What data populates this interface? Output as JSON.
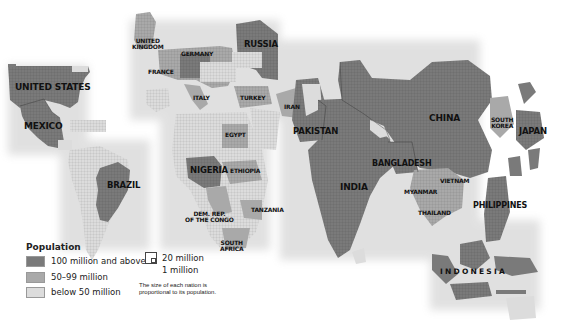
{
  "map": {
    "type": "population cartogram",
    "labels": [
      {
        "id": "united-states",
        "text": "UNITED STATES",
        "x": 15,
        "y": 83,
        "size": 9
      },
      {
        "id": "mexico",
        "text": "MEXICO",
        "x": 24,
        "y": 122,
        "size": 9
      },
      {
        "id": "united-kingdom",
        "text": "UNITED\nKINGDOM",
        "x": 132,
        "y": 38,
        "size": 6
      },
      {
        "id": "germany",
        "text": "GERMANY",
        "x": 181,
        "y": 51,
        "size": 6
      },
      {
        "id": "france",
        "text": "FRANCE",
        "x": 148,
        "y": 69,
        "size": 6
      },
      {
        "id": "russia",
        "text": "RUSSIA",
        "x": 244,
        "y": 40,
        "size": 8.5
      },
      {
        "id": "italy",
        "text": "ITALY",
        "x": 193,
        "y": 95,
        "size": 6
      },
      {
        "id": "turkey",
        "text": "TURKEY",
        "x": 240,
        "y": 95,
        "size": 6
      },
      {
        "id": "iran",
        "text": "IRAN",
        "x": 284,
        "y": 104,
        "size": 6
      },
      {
        "id": "pakistan",
        "text": "PAKISTAN",
        "x": 293,
        "y": 127,
        "size": 8.5
      },
      {
        "id": "egypt",
        "text": "EGYPT",
        "x": 225,
        "y": 132,
        "size": 6
      },
      {
        "id": "china",
        "text": "CHINA",
        "x": 429,
        "y": 114,
        "size": 9
      },
      {
        "id": "south-korea",
        "text": "SOUTH\nKOREA",
        "x": 491,
        "y": 117,
        "size": 6
      },
      {
        "id": "japan",
        "text": "JAPAN",
        "x": 519,
        "y": 127,
        "size": 8.5
      },
      {
        "id": "bangladesh",
        "text": "BANGLADESH",
        "x": 372,
        "y": 160,
        "size": 8
      },
      {
        "id": "india",
        "text": "INDIA",
        "x": 340,
        "y": 183,
        "size": 9
      },
      {
        "id": "vietnam",
        "text": "VIETNAM",
        "x": 440,
        "y": 178,
        "size": 6
      },
      {
        "id": "myanmar",
        "text": "MYANMAR",
        "x": 404,
        "y": 189,
        "size": 6
      },
      {
        "id": "thailand",
        "text": "THAILAND",
        "x": 418,
        "y": 210,
        "size": 6
      },
      {
        "id": "philippines",
        "text": "PHILIPPINES",
        "x": 473,
        "y": 202,
        "size": 8
      },
      {
        "id": "brazil",
        "text": "BRAZIL",
        "x": 107,
        "y": 181,
        "size": 8.5
      },
      {
        "id": "nigeria",
        "text": "NIGERIA",
        "x": 190,
        "y": 166,
        "size": 8.5
      },
      {
        "id": "ethiopia",
        "text": "ETHIOPIA",
        "x": 230,
        "y": 168,
        "size": 6
      },
      {
        "id": "tanzania",
        "text": "TANZANIA",
        "x": 251,
        "y": 207,
        "size": 6
      },
      {
        "id": "dem-rep-congo",
        "text": "DEM. REP.\nOF THE CONGO",
        "x": 185,
        "y": 211,
        "size": 6
      },
      {
        "id": "south-africa",
        "text": "SOUTH\nAFRICA",
        "x": 220,
        "y": 240,
        "size": 6
      },
      {
        "id": "indonesia",
        "text": "I N D O N E S I A",
        "x": 440,
        "y": 268,
        "size": 7.5
      }
    ]
  },
  "legend": {
    "title": "Population",
    "items": [
      {
        "label": "100 million and above",
        "color": "#7a7a7a"
      },
      {
        "label": "50–99 million",
        "color": "#a9a9a9"
      },
      {
        "label": "below 50 million",
        "color": "#dcdcdc"
      }
    ],
    "scale": {
      "large": "20 million",
      "small": "1 million"
    },
    "note_line1": "The size of each nation is",
    "note_line2": "proportional to its population."
  },
  "colors": {
    "high": "#7a7a7a",
    "mid": "#a9a9a9",
    "low": "#dcdcdc",
    "grid": "#5e5e5e",
    "background": "#ffffff"
  }
}
